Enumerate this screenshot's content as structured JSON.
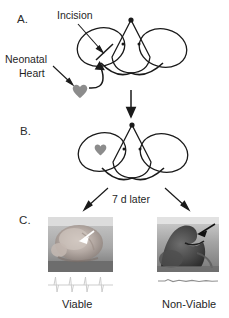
{
  "figure": {
    "type": "scientific-schematic",
    "background_color": "#ffffff",
    "line_color": "#1a1a1a",
    "heart_color": "#8c8c8c",
    "width": 229,
    "height": 318
  },
  "panels": {
    "a": {
      "label": "A.",
      "incision_label": "Incision",
      "neonatal_heart_label_line1": "Neonatal",
      "neonatal_heart_label_line2": "Heart"
    },
    "b": {
      "label": "B."
    },
    "c": {
      "label": "C.",
      "left_caption": "Viable",
      "right_caption": "Non-Viable"
    }
  },
  "transition": {
    "time_label": "7 d later"
  },
  "icons": {
    "heart": "heart-icon",
    "arrow_down": "arrow-down-icon",
    "arrow_incision": "arrow-incision-icon",
    "arrow_neonatal": "arrow-neonatal-icon",
    "arrow_curved_graft": "arrow-curved-graft-icon",
    "arrow_left_outcome": "arrow-left-outcome-icon",
    "arrow_right_outcome": "arrow-right-outcome-icon",
    "arrow_photo_left": "arrow-photo-left-icon",
    "arrow_photo_right": "arrow-photo-right-icon"
  },
  "traces": {
    "left_label": "ecg-active-trace",
    "right_label": "ecg-flat-trace"
  }
}
